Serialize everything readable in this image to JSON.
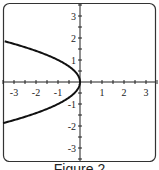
{
  "caption": "Figure 2",
  "chart_data": {
    "type": "line",
    "title": "",
    "xlabel": "",
    "ylabel": "",
    "xlim": [
      -3.5,
      3.5
    ],
    "ylim": [
      -3.5,
      3.5
    ],
    "x_ticks": [
      -3,
      -2,
      -1,
      1,
      2,
      3
    ],
    "y_ticks": [
      -3,
      -2,
      -1,
      1,
      2,
      3
    ],
    "grid": false,
    "series": [
      {
        "name": "x = -y^2",
        "equation": "x = -y^2",
        "points": [
          {
            "x": -3.42,
            "y": 1.85
          },
          {
            "x": -2.25,
            "y": 1.5
          },
          {
            "x": -1,
            "y": 1
          },
          {
            "x": -0.25,
            "y": 0.5
          },
          {
            "x": 0,
            "y": 0
          },
          {
            "x": -0.25,
            "y": -0.5
          },
          {
            "x": -1,
            "y": -1
          },
          {
            "x": -2.25,
            "y": -1.5
          },
          {
            "x": -3.42,
            "y": -1.85
          }
        ]
      }
    ]
  }
}
